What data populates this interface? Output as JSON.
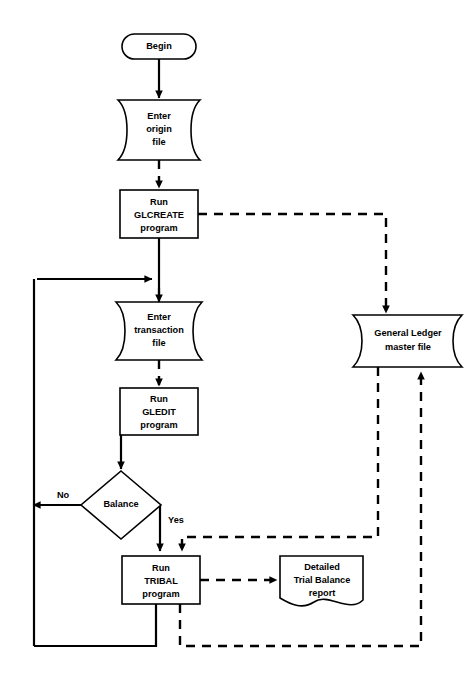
{
  "diagram": {
    "colors": {
      "background": "#ffffff",
      "stroke": "#000000",
      "fill": "#ffffff"
    },
    "nodes": {
      "begin": {
        "shape": "terminator",
        "label": "Begin"
      },
      "enter_origin_file": {
        "shape": "punched-tape",
        "line1": "Enter",
        "line2": "origin",
        "line3": "file"
      },
      "run_glcreate": {
        "shape": "process",
        "line1": "Run",
        "line2": "GLCREATE",
        "line3": "program"
      },
      "enter_transaction_file": {
        "shape": "punched-tape",
        "line1": "Enter",
        "line2": "transaction",
        "line3": "file"
      },
      "run_gledit": {
        "shape": "process",
        "line1": "Run",
        "line2": "GLEDIT",
        "line3": "program"
      },
      "balance_decision": {
        "shape": "decision",
        "label": "Balance"
      },
      "run_tribal": {
        "shape": "process",
        "line1": "Run",
        "line2": "TRIBAL",
        "line3": "program"
      },
      "gl_master_file": {
        "shape": "punched-tape",
        "line1": "General Ledger",
        "line2": "master file"
      },
      "trial_balance_report": {
        "shape": "document",
        "line1": "Detailed",
        "line2": "Trial Balance",
        "line3": "report"
      }
    },
    "edge_labels": {
      "no_branch": "No",
      "yes_branch": "Yes"
    }
  }
}
